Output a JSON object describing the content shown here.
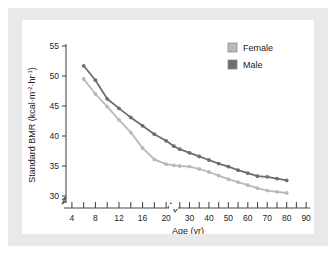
{
  "figure": {
    "background_color": "#ffffff",
    "panel_color": "#e9e9e9",
    "card_color": "#ffffff",
    "axis_color": "#4a4a4a"
  },
  "legend": {
    "position": "top-right",
    "entries": [
      {
        "label": "Female",
        "color": "#b9b9b9"
      },
      {
        "label": "Male",
        "color": "#6e6e6e"
      }
    ]
  },
  "axes": {
    "x": {
      "label_main": "Age (yr)",
      "ticks": [
        "4",
        "8",
        "12",
        "16",
        "20",
        "30",
        "40",
        "50",
        "60",
        "70",
        "80",
        "90"
      ],
      "has_break": true,
      "break_after": "20"
    },
    "y": {
      "label_main": "Standard BMR (kcal·m",
      "label_sup1": "-2",
      "label_mid": "·hr",
      "label_sup2": "-1",
      "label_end": ")",
      "ticks": [
        "30",
        "35",
        "40",
        "45",
        "50",
        "55"
      ],
      "has_break": true
    }
  },
  "chart_data": {
    "type": "line",
    "title": "",
    "xlabel": "Age (yr)",
    "ylabel": "Standard BMR (kcal·m-2·hr-1)",
    "xlim": [
      3,
      92
    ],
    "ylim": [
      29,
      56
    ],
    "grid": false,
    "legend_position": "top right",
    "x_axis_break": true,
    "y_axis_break": true,
    "series": [
      {
        "name": "Male",
        "color": "#6e6e6e",
        "x": [
          6,
          8,
          10,
          12,
          14,
          16,
          18,
          20,
          22,
          25,
          30,
          35,
          40,
          45,
          50,
          55,
          60,
          65,
          70,
          75,
          80
        ],
        "y": [
          51.7,
          49.3,
          46.2,
          44.6,
          43.1,
          41.7,
          40.3,
          39.2,
          38.3,
          37.8,
          37.2,
          36.6,
          36.0,
          35.4,
          34.9,
          34.3,
          33.8,
          33.3,
          33.2,
          32.9,
          32.6
        ]
      },
      {
        "name": "Female",
        "color": "#b9b9b9",
        "x": [
          6,
          8,
          10,
          12,
          14,
          16,
          18,
          20,
          22,
          25,
          30,
          35,
          40,
          45,
          50,
          55,
          60,
          65,
          70,
          75,
          80
        ],
        "y": [
          49.5,
          47.0,
          44.9,
          42.7,
          40.6,
          38.0,
          36.1,
          35.3,
          35.1,
          35.0,
          34.9,
          34.5,
          34.0,
          33.4,
          32.8,
          32.3,
          31.8,
          31.3,
          30.9,
          30.7,
          30.5
        ]
      }
    ]
  }
}
